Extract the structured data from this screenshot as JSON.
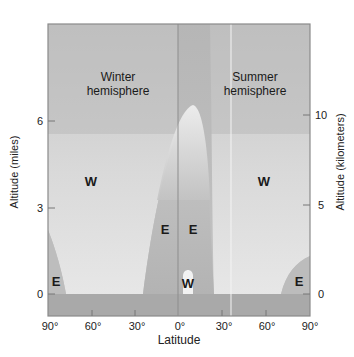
{
  "diagram": {
    "regions": {
      "winter": "Winter\nhemisphere",
      "summer": "Summer\nhemisphere",
      "winter_line1": "Winter",
      "winter_line2": "hemisphere",
      "summer_line1": "Summer",
      "summer_line2": "hemisphere"
    },
    "zones": [
      {
        "label": "W",
        "where": "winter mid-latitudes"
      },
      {
        "label": "W",
        "where": "summer mid-latitudes"
      },
      {
        "label": "E",
        "where": "winter polar surface"
      },
      {
        "label": "E",
        "where": "winter tropics"
      },
      {
        "label": "E",
        "where": "summer tropics"
      },
      {
        "label": "W",
        "where": "equatorial surface bubble"
      },
      {
        "label": "E",
        "where": "summer polar surface"
      }
    ],
    "x_axis": {
      "label": "Latitude",
      "ticks": [
        "90°",
        "60°",
        "30°",
        "0°",
        "30°",
        "60°",
        "90°"
      ]
    },
    "y_axis_left": {
      "label": "Altitude (miles)",
      "ticks": [
        "0",
        "3",
        "6"
      ]
    },
    "y_axis_right": {
      "label": "Altitude (kilometers)",
      "ticks": [
        "0",
        "5",
        "10"
      ]
    },
    "colors": {
      "background_grey": "#b9b9b9",
      "light_zone": "#ececec",
      "ground": "#a9a9a9",
      "frame": "#8a8a8a"
    }
  }
}
